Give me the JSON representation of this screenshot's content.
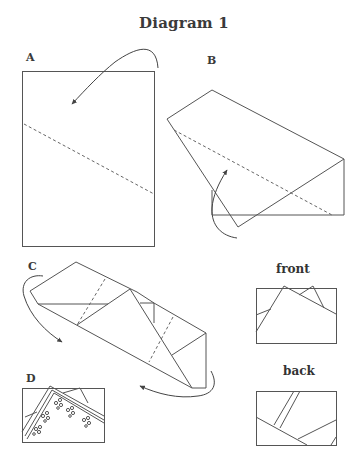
{
  "title": "Diagram 1",
  "panels": {
    "A": {
      "label": "A",
      "description": "Rectangle sheet with diagonal dashed fold line and curved arrow indicating fold of top corner down"
    },
    "B": {
      "label": "B",
      "description": "Sheet after first fold with dashed fold line and curved arrow indicating fold of bottom-left corner up"
    },
    "C": {
      "label": "C",
      "description": "Folded strip with dotted crease lines and two curved arrows indicating wrap folds"
    },
    "D": {
      "label": "D",
      "description": "Finished piece showing decorated folded strips with floral motifs"
    }
  },
  "views": {
    "front": {
      "label": "front"
    },
    "back": {
      "label": "back"
    }
  },
  "colors": {
    "line": "#555555",
    "text": "#3a3a3a",
    "background": "#ffffff"
  }
}
